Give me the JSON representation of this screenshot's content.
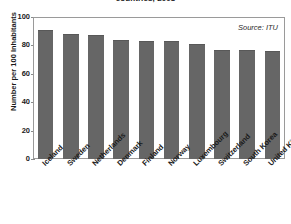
{
  "chart_data": {
    "type": "bar",
    "title": "countries, 2008",
    "title_note": "title is cropped off the top edge of the screenshot",
    "xlabel": "",
    "ylabel": "Number per 100 Inhabitants",
    "ylim": [
      0,
      100
    ],
    "yticks": [
      0,
      20,
      40,
      60,
      80,
      100
    ],
    "ytick_labels": [
      "0",
      "20",
      "40",
      "60",
      "80",
      "100"
    ],
    "grid": false,
    "legend": "none",
    "annotations": [
      {
        "text": "Source: ITU",
        "position": "top-right-inside-plot",
        "style": "italic"
      }
    ],
    "bar_color": "#666666",
    "frame_color": "#9a9a9a",
    "categories": [
      "Iceland",
      "Sweden",
      "Netherlands",
      "Denmark",
      "Finland",
      "Norway",
      "Luxembourg",
      "Switzerland",
      "South Korea",
      "United Kingdom"
    ],
    "values": [
      91,
      88,
      87,
      84,
      83,
      83,
      81,
      77,
      77,
      76
    ]
  },
  "source_note": "Source: ITU"
}
